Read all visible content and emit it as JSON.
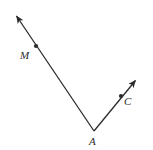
{
  "figure": {
    "type": "geometry-diagram",
    "width": 153,
    "height": 150,
    "background_color": "#ffffff",
    "stroke_color": "#2b2b2b",
    "stroke_width": 1.3,
    "labels": [
      {
        "id": "M",
        "text": "M",
        "x": 26,
        "y": 56
      },
      {
        "id": "A",
        "text": "A",
        "x": 94,
        "y": 142
      },
      {
        "id": "C",
        "text": "C",
        "x": 129,
        "y": 102
      }
    ],
    "points": [
      {
        "id": "vertex-A",
        "label": "A",
        "x": 94,
        "y": 131,
        "marked_dot": false
      },
      {
        "id": "point-M",
        "label": "M",
        "x": 36,
        "y": 46,
        "marked_dot": true
      },
      {
        "id": "point-C",
        "label": "C",
        "x": 121,
        "y": 96,
        "marked_dot": true
      }
    ],
    "rays": [
      {
        "id": "ray-AM",
        "from": "A",
        "through": "M",
        "start": {
          "x": 94,
          "y": 131
        },
        "end": {
          "x": 13,
          "y": 12
        },
        "arrowhead_at_end": true
      },
      {
        "id": "ray-AC",
        "from": "A",
        "through": "C",
        "start": {
          "x": 94,
          "y": 131
        },
        "end": {
          "x": 139,
          "y": 76
        },
        "arrowhead_at_end": true
      }
    ]
  }
}
